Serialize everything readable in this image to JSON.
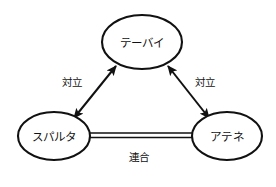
{
  "diagram": {
    "title": "",
    "background_color": "#ffffff",
    "stroke_color": "#111111",
    "node_fill_color": "#ffffff",
    "nodes": [
      {
        "id": "thebes",
        "label": "テーバイ",
        "shape": "ellipse",
        "cx": 142,
        "cy": 42,
        "rx": 40,
        "ry": 27
      },
      {
        "id": "sparta",
        "label": "スパルタ",
        "shape": "ellipse",
        "cx": 54,
        "cy": 136,
        "rx": 36,
        "ry": 24
      },
      {
        "id": "athens",
        "label": "アテネ",
        "shape": "ellipse",
        "cx": 227,
        "cy": 136,
        "rx": 35,
        "ry": 24
      }
    ],
    "edges": [
      {
        "id": "sparta-thebes",
        "from": "sparta",
        "to": "thebes",
        "label": "対立",
        "style": "double-headed-arrow",
        "label_x": 72,
        "label_y": 82
      },
      {
        "id": "thebes-athens",
        "from": "thebes",
        "to": "athens",
        "label": "対立",
        "style": "double-headed-arrow",
        "label_x": 205,
        "label_y": 82
      },
      {
        "id": "sparta-athens",
        "from": "sparta",
        "to": "athens",
        "label": "連合",
        "style": "double-line",
        "label_x": 139,
        "label_y": 157
      }
    ]
  }
}
